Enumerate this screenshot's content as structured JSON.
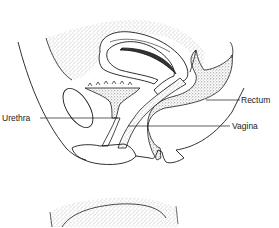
{
  "diagram": {
    "labels": {
      "urethra": "Urethra",
      "rectum": "Rectum",
      "vagina": "Vagina"
    },
    "colors": {
      "line": "#1a1a1a",
      "stipple": "#8a8a8a",
      "background": "#ffffff"
    }
  }
}
